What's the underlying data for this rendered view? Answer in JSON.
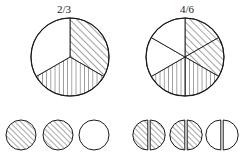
{
  "figure": {
    "title": "",
    "type": "equivalent-fractions-diagram",
    "background_color": "#ffffff",
    "stroke_color": "#1a1a1a",
    "hatch_color": "#333333",
    "fill_color": "#ffffff"
  },
  "groups": [
    {
      "id": "left",
      "label": "2/3",
      "label_x": 64,
      "label_y": 13,
      "pie": {
        "cx": 70,
        "cy": 57,
        "r": 39,
        "total_sectors": 3,
        "shaded_sectors": 2,
        "sector_angle_deg": 120,
        "start_angle_deg": -90,
        "sectors": [
          {
            "index": 0,
            "from_deg": -90,
            "to_deg": 30,
            "pattern": "diagonal"
          },
          {
            "index": 1,
            "from_deg": 30,
            "to_deg": 150,
            "pattern": "vertical"
          },
          {
            "index": 2,
            "from_deg": 150,
            "to_deg": 270,
            "pattern": "none"
          }
        ]
      },
      "units": {
        "count": 3,
        "radius": 15,
        "cy": 135,
        "centers_x": [
          21,
          58,
          94
        ],
        "split": false,
        "items": [
          {
            "index": 0,
            "pattern": "diagonal"
          },
          {
            "index": 1,
            "pattern": "diagonal"
          },
          {
            "index": 2,
            "pattern": "none"
          }
        ]
      }
    },
    {
      "id": "right",
      "label": "4/6",
      "label_x": 187,
      "label_y": 13,
      "pie": {
        "cx": 185,
        "cy": 57,
        "r": 39,
        "total_sectors": 6,
        "shaded_sectors": 4,
        "sector_angle_deg": 60,
        "start_angle_deg": -90,
        "sectors": [
          {
            "index": 0,
            "from_deg": -90,
            "to_deg": -30,
            "pattern": "diagonal"
          },
          {
            "index": 1,
            "from_deg": -30,
            "to_deg": 30,
            "pattern": "diagonal"
          },
          {
            "index": 2,
            "from_deg": 30,
            "to_deg": 90,
            "pattern": "vertical"
          },
          {
            "index": 3,
            "from_deg": 90,
            "to_deg": 150,
            "pattern": "vertical"
          },
          {
            "index": 4,
            "from_deg": 150,
            "to_deg": 210,
            "pattern": "none"
          },
          {
            "index": 5,
            "from_deg": 210,
            "to_deg": 270,
            "pattern": "none"
          }
        ]
      },
      "units": {
        "count": 3,
        "radius": 15,
        "cy": 135,
        "centers_x": [
          149,
          186,
          222
        ],
        "split": true,
        "halves": [
          {
            "index": 0,
            "circle": 0,
            "side": "left",
            "pattern": "diagonal"
          },
          {
            "index": 1,
            "circle": 0,
            "side": "right",
            "pattern": "diagonal"
          },
          {
            "index": 2,
            "circle": 1,
            "side": "left",
            "pattern": "diagonal"
          },
          {
            "index": 3,
            "circle": 1,
            "side": "right",
            "pattern": "diagonal"
          },
          {
            "index": 4,
            "circle": 2,
            "side": "left",
            "pattern": "none"
          },
          {
            "index": 5,
            "circle": 2,
            "side": "right",
            "pattern": "none"
          }
        ]
      }
    }
  ]
}
